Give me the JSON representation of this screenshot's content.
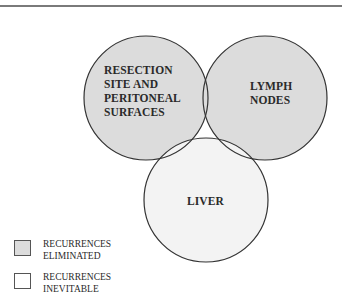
{
  "diagram": {
    "type": "venn",
    "circles": [
      {
        "id": "resection",
        "label_lines": [
          "RESECTION",
          "SITE AND",
          "PERITONEAL",
          "SURFACES"
        ],
        "fill": "#dcdcdc",
        "category": "eliminated"
      },
      {
        "id": "lymph",
        "label_lines": [
          "LYMPH",
          "NODES"
        ],
        "fill": "#dcdcdc",
        "category": "eliminated"
      },
      {
        "id": "liver",
        "label_lines": [
          "LIVER"
        ],
        "fill": "#f3f3f3",
        "category": "inevitable"
      }
    ],
    "stroke_color": "#333333"
  },
  "labels": {
    "resection": "RESECTION\nSITE AND\nPERITONEAL\nSURFACES",
    "resection_1": "RESECTION",
    "resection_2": "SITE AND",
    "resection_3": "PERITONEAL",
    "resection_4": "SURFACES",
    "lymph_1": "LYMPH",
    "lymph_2": "NODES",
    "liver": "LIVER"
  },
  "legend": {
    "items": [
      {
        "line1": "RECURRENCES",
        "line2": "ELIMINATED",
        "color": "#dcdcdc"
      },
      {
        "line1": "RECURRENCES",
        "line2": "INEVITABLE",
        "color": "#ffffff"
      }
    ]
  }
}
